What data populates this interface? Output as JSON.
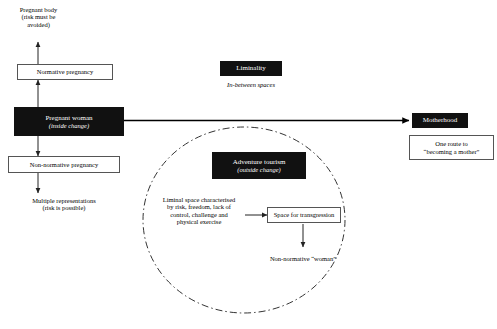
{
  "diagram": {
    "nodes": {
      "pregnant_body": {
        "label": "Pregnant body\n(risk must be\navoided)",
        "style": "plain"
      },
      "normative_pregnancy": {
        "label": "Normative pregnancy",
        "style": "boxed"
      },
      "pregnant_woman": {
        "label": "Pregnant woman",
        "sublabel": "(inside change)",
        "style": "filled"
      },
      "non_normative_pregnancy": {
        "label": "Non-normative pregnancy",
        "style": "boxed"
      },
      "multiple_representations": {
        "label": "Multiple representations\n(risk is possible)",
        "style": "plain"
      },
      "liminality": {
        "label": "Liminality",
        "style": "filled"
      },
      "in_between_spaces": {
        "label": "In-between spaces",
        "style": "plain-italic"
      },
      "motherhood": {
        "label": "Motherhood",
        "style": "filled"
      },
      "one_route": {
        "label": "One route  to\n“becoming a mother”",
        "style": "boxed"
      },
      "adventure_tourism": {
        "label": "Adventure tourism",
        "sublabel": "(outside change)",
        "style": "filled"
      },
      "liminal_space": {
        "label": "Liminal space characterised\nby risk, freedom, lack of\ncontrol, challenge and\nphysical exercise",
        "style": "plain"
      },
      "space_for_transgression": {
        "label": "Space for transgression",
        "style": "boxed"
      },
      "non_normative_woman": {
        "label": "Non-normative “woman”",
        "style": "plain"
      }
    },
    "circle": {
      "name": "liminal-space-circle",
      "stroke_style": "dash-dot",
      "color": "#333333"
    },
    "colors": {
      "fill_dark": "#111111",
      "text_light": "#ffffff",
      "line": "#333333",
      "box_border": "#555555"
    }
  }
}
